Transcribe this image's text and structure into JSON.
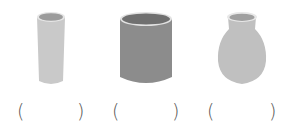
{
  "items": [
    {
      "name": "tall-glass",
      "answer": ""
    },
    {
      "name": "cylinder-cup",
      "answer": ""
    },
    {
      "name": "vase",
      "answer": ""
    }
  ],
  "brackets": {
    "open": "(",
    "close": ")"
  },
  "colors": {
    "glass_body": "#c8c8c8",
    "glass_inner": "#9a9a9a",
    "cylinder_body": "#8a8a8a",
    "cylinder_inner": "#6e6e6e",
    "vase_body": "#bdbdbd",
    "vase_inner": "#9c9c9c",
    "rim": "#e6e6e6"
  }
}
